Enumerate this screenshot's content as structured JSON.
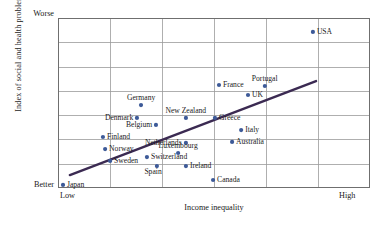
{
  "chart_data": {
    "type": "scatter",
    "title": "",
    "xlabel": "Income inequality",
    "ylabel": "Index of social and health problems",
    "xlim": [
      0,
      100
    ],
    "ylim": [
      0,
      100
    ],
    "x_tick_labels": [
      "Low",
      "High"
    ],
    "y_tick_labels": [
      "Better",
      "Worse"
    ],
    "grid": true,
    "grid_columns": 6,
    "grid_rows": 7,
    "legend": "none",
    "point_color": "#3d5a98",
    "trendline_color": "#3b2a52",
    "trendline": {
      "x_start": 3.8,
      "y_start": 7.6,
      "x_end": 82.7,
      "y_end": 62.9
    },
    "points": [
      {
        "label": "Japan",
        "x": 1.6,
        "y": 1.8,
        "label_pos": "right"
      },
      {
        "label": "Sweden",
        "x": 16.7,
        "y": 15.9,
        "label_pos": "right"
      },
      {
        "label": "Norway",
        "x": 15.1,
        "y": 22.9,
        "label_pos": "right"
      },
      {
        "label": "Finland",
        "x": 14.4,
        "y": 30.0,
        "label_pos": "right"
      },
      {
        "label": "Denmark",
        "x": 25.3,
        "y": 41.2,
        "label_pos": "left"
      },
      {
        "label": "Germany",
        "x": 26.6,
        "y": 48.8,
        "label_pos": "above"
      },
      {
        "label": "Belgium",
        "x": 31.4,
        "y": 37.1,
        "label_pos": "left"
      },
      {
        "label": "Switzerland",
        "x": 28.5,
        "y": 18.2,
        "label_pos": "right"
      },
      {
        "label": "Spain",
        "x": 31.7,
        "y": 12.9,
        "label_pos": "below-left"
      },
      {
        "label": "Luxembourg",
        "x": 38.5,
        "y": 20.6,
        "label_pos": "above"
      },
      {
        "label": "New Zealand",
        "x": 41.0,
        "y": 41.2,
        "label_pos": "above"
      },
      {
        "label": "Netherlands",
        "x": 41.0,
        "y": 26.5,
        "label_pos": "left"
      },
      {
        "label": "Ireland",
        "x": 41.0,
        "y": 12.9,
        "label_pos": "right"
      },
      {
        "label": "Greece",
        "x": 50.3,
        "y": 41.2,
        "label_pos": "right"
      },
      {
        "label": "France",
        "x": 51.6,
        "y": 60.6,
        "label_pos": "right"
      },
      {
        "label": "Canada",
        "x": 49.7,
        "y": 4.7,
        "label_pos": "right"
      },
      {
        "label": "Australia",
        "x": 55.8,
        "y": 27.1,
        "label_pos": "right"
      },
      {
        "label": "Italy",
        "x": 58.7,
        "y": 34.1,
        "label_pos": "right"
      },
      {
        "label": "UK",
        "x": 60.9,
        "y": 54.7,
        "label_pos": "right"
      },
      {
        "label": "Portugal",
        "x": 66.3,
        "y": 60.0,
        "label_pos": "above"
      },
      {
        "label": "USA",
        "x": 81.7,
        "y": 91.8,
        "label_pos": "right"
      }
    ]
  }
}
